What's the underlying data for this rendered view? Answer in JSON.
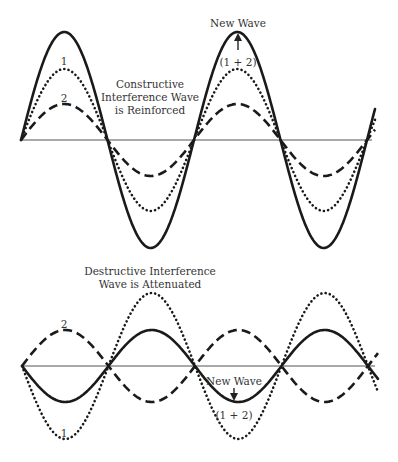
{
  "colors": {
    "background": "#ffffff",
    "wave": "#1a1a1a",
    "axis": "#555555",
    "text": "#333333"
  },
  "constructive": {
    "caption_lines": [
      "Constructive",
      "Interference Wave",
      "is Reinforced"
    ],
    "wave1_label": "1",
    "wave2_label": "2",
    "new_wave_label": "New Wave",
    "sum_label": "(1 + 2)",
    "axis": {
      "y": 140,
      "x_start": 21,
      "x_end": 372
    },
    "half_period": 86.5,
    "x_end_wave": 375,
    "wave1": {
      "style": "dotted",
      "amplitude": 71,
      "phase_sign": 1
    },
    "wave2": {
      "style": "dashed",
      "amplitude": 36,
      "phase_sign": 1
    },
    "new_wave": {
      "style": "solid",
      "amplitude": 108,
      "phase_sign": 1
    }
  },
  "destructive": {
    "caption_lines": [
      "Destructive Interference",
      "Wave is Attenuated"
    ],
    "wave1_label": "1",
    "wave2_label": "2",
    "new_wave_label": "New Wave",
    "sum_label": "(1 + 2)",
    "axis": {
      "y": 366,
      "x_start": 22,
      "x_end": 375
    },
    "half_period": 86.5,
    "x_end_wave": 378,
    "wave1": {
      "style": "dotted",
      "amplitude": 73,
      "phase_sign": -1
    },
    "wave2": {
      "style": "dashed",
      "amplitude": 36,
      "phase_sign": 1
    },
    "new_wave": {
      "style": "solid",
      "amplitude": 36,
      "phase_sign": -1
    }
  }
}
